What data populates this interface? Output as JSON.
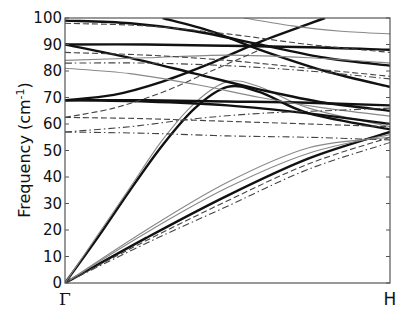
{
  "chart_data": {
    "type": "line",
    "title": "",
    "xlabel": "",
    "ylabel": "Frequency (cm-1)",
    "ylabel_parts": {
      "main": "Frequency (cm",
      "sup": "-1",
      "close": ")"
    },
    "ylim": [
      0,
      100
    ],
    "yticks": [
      0,
      10,
      20,
      30,
      40,
      50,
      60,
      70,
      80,
      90,
      100
    ],
    "xticks": [
      "Γ",
      "H"
    ],
    "x_domain": [
      0,
      1
    ],
    "grid": false,
    "legend": null,
    "data_note": "Band curves were traced by eye from the screenshot; frequencies are approximate (about ±2–3 cm^-1).",
    "series": [
      {
        "name": "acoustic-TA1",
        "style": "solid",
        "weight": "bold",
        "x": [
          0,
          0.25,
          0.5,
          0.75,
          1
        ],
        "y": [
          0,
          17,
          33,
          47,
          57
        ]
      },
      {
        "name": "acoustic-TA1-alt",
        "style": "solid",
        "weight": "thin",
        "x": [
          0,
          0.25,
          0.5,
          0.75,
          1
        ],
        "y": [
          0,
          19,
          36,
          49,
          56
        ]
      },
      {
        "name": "acoustic-TA2-alt",
        "style": "solid",
        "weight": "thin",
        "x": [
          0,
          0.25,
          0.5,
          0.75,
          1
        ],
        "y": [
          0,
          20,
          38,
          51,
          55
        ]
      },
      {
        "name": "acoustic-TA-dash",
        "style": "dashed",
        "weight": "thin",
        "x": [
          0,
          0.25,
          0.5,
          0.75,
          1
        ],
        "y": [
          0,
          16,
          31,
          45,
          55
        ]
      },
      {
        "name": "acoustic-TA-dashdot",
        "style": "dashdot",
        "weight": "thin",
        "x": [
          0,
          0.25,
          0.5,
          0.75,
          1
        ],
        "y": [
          0,
          15,
          29,
          43,
          53
        ]
      },
      {
        "name": "acoustic-LA",
        "style": "solid",
        "weight": "bold",
        "x": [
          0,
          0.1,
          0.2,
          0.3,
          0.4,
          0.5,
          0.6,
          0.75,
          1
        ],
        "y": [
          0,
          17,
          35,
          52,
          66,
          74,
          72,
          64,
          58
        ]
      },
      {
        "name": "acoustic-LA-alt",
        "style": "solid",
        "weight": "thin",
        "x": [
          0,
          0.1,
          0.2,
          0.3,
          0.4,
          0.5,
          0.6,
          0.75,
          1
        ],
        "y": [
          0,
          18,
          36,
          54,
          68,
          76,
          74,
          66,
          59
        ]
      },
      {
        "name": "optical-69",
        "style": "solid",
        "weight": "bold",
        "x": [
          0,
          0.25,
          0.5,
          0.75,
          1
        ],
        "y": [
          69,
          69,
          68.5,
          68,
          67
        ]
      },
      {
        "name": "optical-69-up",
        "style": "solid",
        "weight": "bold",
        "x": [
          0,
          0.15,
          0.3,
          0.45,
          0.6,
          0.8
        ],
        "y": [
          69,
          71,
          76,
          83,
          91,
          100
        ]
      },
      {
        "name": "optical-69-down",
        "style": "solid",
        "weight": "bold",
        "x": [
          0,
          0.25,
          0.5,
          0.75,
          1
        ],
        "y": [
          69,
          68.5,
          67,
          64,
          60
        ]
      },
      {
        "name": "optical-90",
        "style": "solid",
        "weight": "bold",
        "x": [
          0,
          0.25,
          0.5,
          0.75,
          1
        ],
        "y": [
          90,
          90,
          89.5,
          89,
          88
        ]
      },
      {
        "name": "optical-90-down",
        "style": "solid",
        "weight": "bold",
        "x": [
          0,
          0.2,
          0.4,
          0.6,
          0.8,
          1
        ],
        "y": [
          90,
          85,
          79,
          73,
          68,
          65
        ]
      },
      {
        "name": "optical-99",
        "style": "solid",
        "weight": "bold",
        "x": [
          0,
          0.2,
          0.4,
          0.6,
          0.8,
          1
        ],
        "y": [
          99,
          98,
          95,
          90,
          85,
          82
        ]
      },
      {
        "name": "optical-99-b",
        "style": "solid",
        "weight": "bold",
        "x": [
          0.3,
          0.45,
          0.6,
          0.8,
          1
        ],
        "y": [
          100,
          95,
          88,
          80,
          74
        ]
      },
      {
        "name": "optical-80-thin",
        "style": "solid",
        "weight": "thin",
        "x": [
          0,
          0.2,
          0.4,
          0.6,
          0.8,
          1
        ],
        "y": [
          81,
          79,
          75,
          70,
          66,
          63
        ]
      },
      {
        "name": "optical-84-thin",
        "style": "solid",
        "weight": "thin",
        "x": [
          0,
          0.25,
          0.5,
          0.75,
          1
        ],
        "y": [
          84,
          85,
          86,
          85,
          83
        ]
      },
      {
        "name": "optical-top-thin",
        "style": "solid",
        "weight": "thin",
        "x": [
          0.55,
          0.7,
          0.85,
          1
        ],
        "y": [
          100,
          97,
          95,
          94
        ]
      },
      {
        "name": "optical-87-dash",
        "style": "dashed",
        "weight": "thin",
        "x": [
          0,
          0.25,
          0.5,
          0.75,
          1
        ],
        "y": [
          87,
          86,
          84,
          81,
          78
        ]
      },
      {
        "name": "optical-83-dashdot",
        "style": "dashdot",
        "weight": "thin",
        "x": [
          0,
          0.25,
          0.5,
          0.75,
          1
        ],
        "y": [
          83,
          83,
          82,
          80,
          77
        ]
      },
      {
        "name": "optical-98-dash",
        "style": "dashed",
        "weight": "thin",
        "x": [
          0,
          0.25,
          0.5,
          0.75,
          1
        ],
        "y": [
          98,
          97,
          94,
          90,
          87
        ]
      },
      {
        "name": "optical-62-dash",
        "style": "dashed",
        "weight": "thin",
        "x": [
          0,
          0.25,
          0.5,
          0.75,
          1
        ],
        "y": [
          62.5,
          62,
          61,
          60,
          59
        ]
      },
      {
        "name": "optical-62-dash-up",
        "style": "dashed",
        "weight": "thin",
        "x": [
          0,
          0.15,
          0.3,
          0.45,
          0.6
        ],
        "y": [
          62.5,
          66,
          72,
          80,
          88
        ]
      },
      {
        "name": "optical-57-dashdot",
        "style": "dashdot",
        "weight": "thin",
        "x": [
          0,
          0.25,
          0.5,
          0.75,
          1
        ],
        "y": [
          57,
          56.5,
          55.5,
          55,
          54
        ]
      },
      {
        "name": "optical-57-dashdot-up",
        "style": "dashdot",
        "weight": "thin",
        "x": [
          0,
          0.2,
          0.4,
          0.6,
          0.8,
          1
        ],
        "y": [
          57,
          59,
          62,
          64,
          65,
          66
        ]
      }
    ]
  },
  "axes": {
    "ylabel_main": "Frequency (cm",
    "ylabel_sup": "-1",
    "ylabel_close": ")",
    "y_tick_labels": [
      "0",
      "10",
      "20",
      "30",
      "40",
      "50",
      "60",
      "70",
      "80",
      "90",
      "100"
    ],
    "x_tick_labels": [
      "Γ",
      "H"
    ]
  }
}
